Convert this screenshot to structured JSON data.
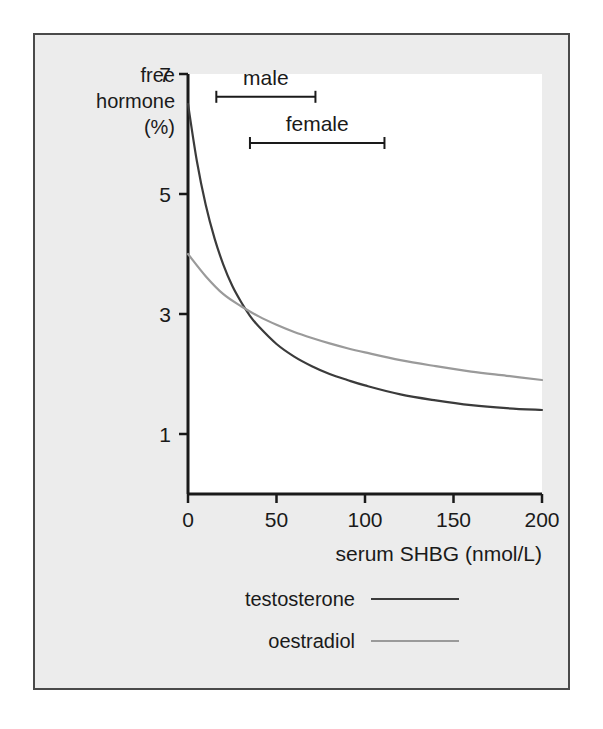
{
  "figure": {
    "background_color": "#ececec",
    "plot_background_color": "#ffffff",
    "border_color": "#4a4a4a"
  },
  "chart_data": {
    "type": "line",
    "title": "",
    "xlabel": "serum SHBG (nmol/L)",
    "ylabel": "free hormone (%)",
    "ylabel_lines": [
      "free",
      "hormone",
      "(%)"
    ],
    "xlim": [
      0,
      200
    ],
    "ylim": [
      0,
      7
    ],
    "xticks": [
      0,
      50,
      100,
      150,
      200
    ],
    "xtick_labels": [
      "0",
      "50",
      "100",
      "150",
      "200"
    ],
    "yticks": [
      1,
      3,
      5,
      7
    ],
    "ytick_labels": [
      "1",
      "3",
      "5",
      "7"
    ],
    "grid": false,
    "legend_position": "below-axes",
    "series": [
      {
        "name": "testosterone",
        "color": "#3b3b3b",
        "x": [
          0,
          5,
          10,
          15,
          20,
          25,
          30,
          35,
          40,
          50,
          60,
          70,
          80,
          90,
          100,
          120,
          140,
          160,
          180,
          200
        ],
        "y": [
          6.5,
          5.55,
          4.82,
          4.26,
          3.82,
          3.47,
          3.2,
          2.97,
          2.79,
          2.5,
          2.29,
          2.13,
          2.0,
          1.9,
          1.81,
          1.66,
          1.56,
          1.48,
          1.43,
          1.4
        ]
      },
      {
        "name": "oestradiol",
        "color": "#9a9a9a",
        "x": [
          0,
          10,
          20,
          30,
          40,
          50,
          60,
          70,
          80,
          90,
          100,
          120,
          140,
          160,
          180,
          200
        ],
        "y": [
          4.0,
          3.63,
          3.33,
          3.13,
          2.96,
          2.82,
          2.7,
          2.6,
          2.51,
          2.43,
          2.36,
          2.23,
          2.13,
          2.04,
          1.97,
          1.9
        ]
      }
    ],
    "annotations": [
      {
        "label": "male",
        "x_start": 16,
        "x_end": 72,
        "y_level": 6.62
      },
      {
        "label": "female",
        "x_start": 35,
        "x_end": 111,
        "y_level": 5.85
      }
    ]
  },
  "legend": {
    "items": [
      {
        "label": "testosterone",
        "color": "#3b3b3b"
      },
      {
        "label": "oestradiol",
        "color": "#9a9a9a"
      }
    ]
  }
}
